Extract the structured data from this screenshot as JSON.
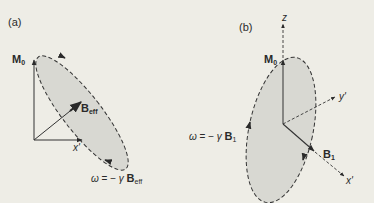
{
  "panels": [
    {
      "id": "a",
      "label": "(a)",
      "vectors": {
        "magnetization": {
          "label": "M",
          "sub": "0"
        },
        "effective_field": {
          "label": "B",
          "sub": "eff"
        },
        "x_axis": {
          "label": "x'"
        }
      },
      "equation": {
        "omega": "ω",
        "equals": "=",
        "minus": "−",
        "gamma": "γ",
        "field": "B",
        "sub": "eff"
      }
    },
    {
      "id": "b",
      "label": "(b)",
      "vectors": {
        "magnetization": {
          "label": "M",
          "sub": "0"
        },
        "field": {
          "label": "B",
          "sub": "1"
        },
        "z_axis": {
          "label": "z"
        },
        "y_axis": {
          "label": "y'"
        },
        "x_axis": {
          "label": "x'"
        }
      },
      "equation": {
        "omega": "ω",
        "equals": "=",
        "minus": "−",
        "gamma": "γ",
        "field": "B",
        "sub": "1"
      }
    }
  ],
  "colors": {
    "background": "#eeede6",
    "ellipse_fill": "#d6d6d0",
    "ink": "#2a2a2a"
  }
}
